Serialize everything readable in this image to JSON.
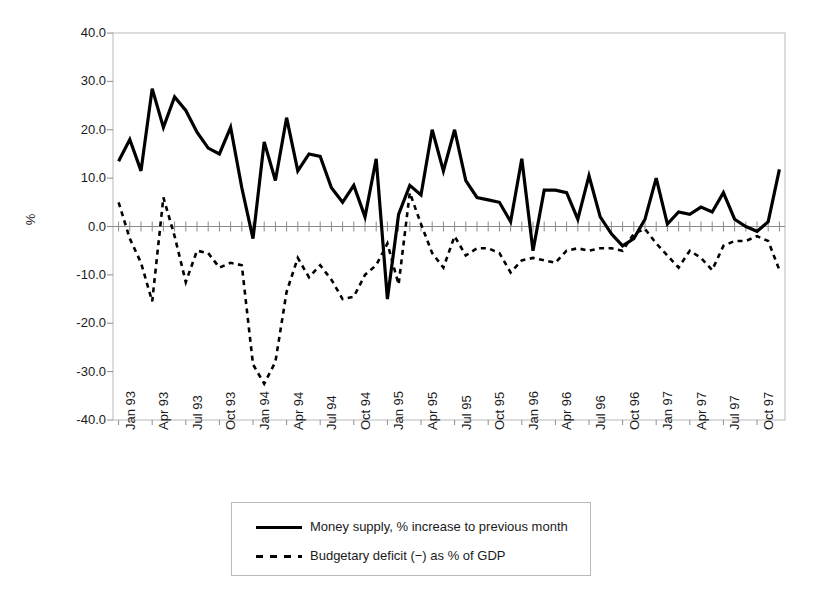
{
  "chart_data": {
    "type": "line",
    "title": "",
    "xlabel": "",
    "ylabel": "%",
    "ylim": [
      -40,
      40
    ],
    "ytick_step": 10,
    "grid": false,
    "legend_position": "bottom",
    "ytick_labels": [
      "40.0",
      "30.0",
      "20.0",
      "10.0",
      "0.0",
      "-10.0",
      "-20.0",
      "-30.0",
      "-40.0"
    ],
    "ytick_values": [
      40,
      30,
      20,
      10,
      0,
      -10,
      -20,
      -30,
      -40
    ],
    "xtick_labels": [
      "Jan 93",
      "Apr 93",
      "Jul 93",
      "Oct 93",
      "Jan 94",
      "Apr 94",
      "Jul 94",
      "Oct 94",
      "Jan 95",
      "Apr 95",
      "Jul 95",
      "Oct 95",
      "Jan 96",
      "Apr 96",
      "Jul 96",
      "Oct 96",
      "Jan 97",
      "Apr 97",
      "Jul 97",
      "Oct 97"
    ],
    "xtick_indices": [
      0,
      3,
      6,
      9,
      12,
      15,
      18,
      21,
      24,
      27,
      30,
      33,
      36,
      39,
      42,
      45,
      48,
      51,
      54,
      57
    ],
    "x": [
      "Jan 93",
      "Feb 93",
      "Mar 93",
      "Apr 93",
      "May 93",
      "Jun 93",
      "Jul 93",
      "Aug 93",
      "Sep 93",
      "Oct 93",
      "Nov 93",
      "Dec 93",
      "Jan 94",
      "Feb 94",
      "Mar 94",
      "Apr 94",
      "May 94",
      "Jun 94",
      "Jul 94",
      "Aug 94",
      "Sep 94",
      "Oct 94",
      "Nov 94",
      "Dec 94",
      "Jan 95",
      "Feb 95",
      "Mar 95",
      "Apr 95",
      "May 95",
      "Jun 95",
      "Jul 95",
      "Aug 95",
      "Sep 95",
      "Oct 95",
      "Nov 95",
      "Dec 95",
      "Jan 96",
      "Feb 96",
      "Mar 96",
      "Apr 96",
      "May 96",
      "Jun 96",
      "Jul 96",
      "Aug 96",
      "Sep 96",
      "Oct 96",
      "Nov 96",
      "Dec 96",
      "Jan 97",
      "Feb 97",
      "Mar 97",
      "Apr 97",
      "May 97",
      "Jun 97",
      "Jul 97",
      "Aug 97",
      "Sep 97",
      "Oct 97",
      "Nov 97",
      "Dec 97"
    ],
    "series": [
      {
        "name": "Money supply, % increase to previous month",
        "style": "solid",
        "color": "#000000",
        "values": [
          13.5,
          18.0,
          11.5,
          28.5,
          20.5,
          26.8,
          24.0,
          19.5,
          16.2,
          15.0,
          20.5,
          8.0,
          -2.5,
          17.5,
          9.5,
          22.5,
          11.5,
          15.0,
          14.5,
          8.0,
          5.0,
          8.5,
          2.0,
          14.0,
          -15.0,
          2.5,
          8.5,
          6.5,
          20.0,
          11.5,
          20.0,
          9.5,
          6.0,
          5.5,
          5.0,
          1.0,
          14.0,
          -5.0,
          7.5,
          7.5,
          7.0,
          1.5,
          10.5,
          2.0,
          -1.5,
          -4.0,
          -2.5,
          1.5,
          10.0,
          0.5,
          3.0,
          2.5,
          4.0,
          3.0,
          7.0,
          1.5,
          0.0,
          -1.0,
          1.0,
          11.8
        ]
      },
      {
        "name": "Budgetary deficit (−) as % of GDP",
        "style": "dashed",
        "color": "#000000",
        "values": [
          5.0,
          -2.5,
          -7.5,
          -15.5,
          6.0,
          -2.0,
          -11.5,
          -5.0,
          -5.5,
          -8.5,
          -7.5,
          -8.0,
          -28.5,
          -32.5,
          -28.0,
          -13.5,
          -6.5,
          -10.5,
          -8.0,
          -11.0,
          -15.0,
          -14.5,
          -10.0,
          -8.0,
          -3.5,
          -12.0,
          7.0,
          0.5,
          -5.5,
          -8.5,
          -2.0,
          -6.0,
          -4.5,
          -4.5,
          -5.5,
          -9.5,
          -7.0,
          -6.5,
          -7.0,
          -7.5,
          -5.0,
          -4.5,
          -5.0,
          -4.5,
          -4.5,
          -5.0,
          -1.5,
          -0.5,
          -3.5,
          -6.0,
          -8.5,
          -5.0,
          -6.5,
          -9.0,
          -4.0,
          -3.0,
          -3.0,
          -2.0,
          -3.0,
          -9.0
        ]
      }
    ]
  },
  "legend": {
    "items": [
      {
        "label": "Money supply, % increase to previous month",
        "style": "solid"
      },
      {
        "label": "Budgetary deficit (−) as % of GDP",
        "style": "dashed"
      }
    ]
  }
}
